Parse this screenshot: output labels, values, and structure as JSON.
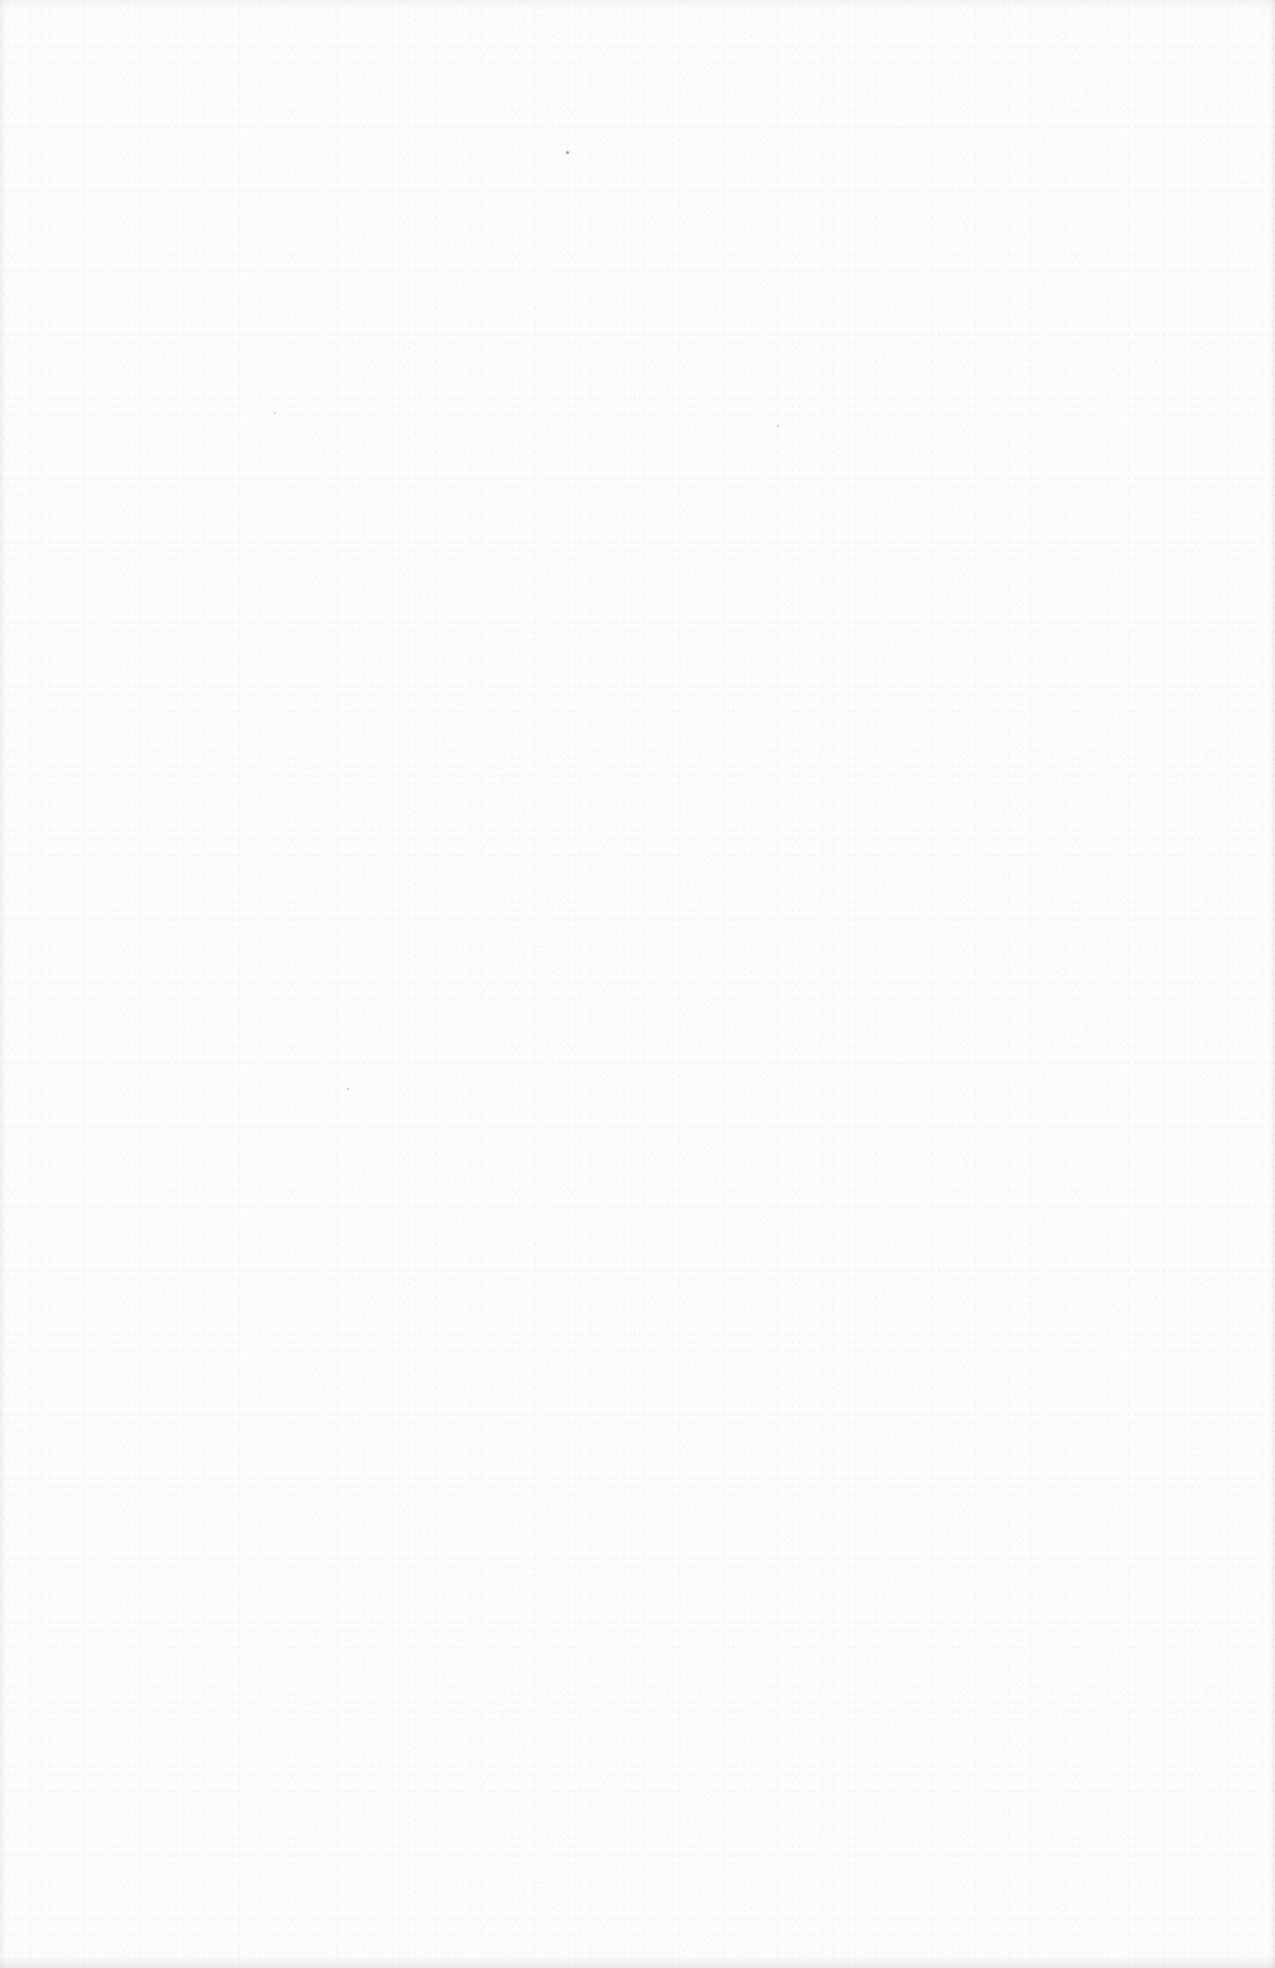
{
  "page": {
    "type": "blank-scanned-page",
    "text_content": [],
    "colors": {
      "paper": "#fdfdfd",
      "speck": "#9a9a9a"
    }
  }
}
